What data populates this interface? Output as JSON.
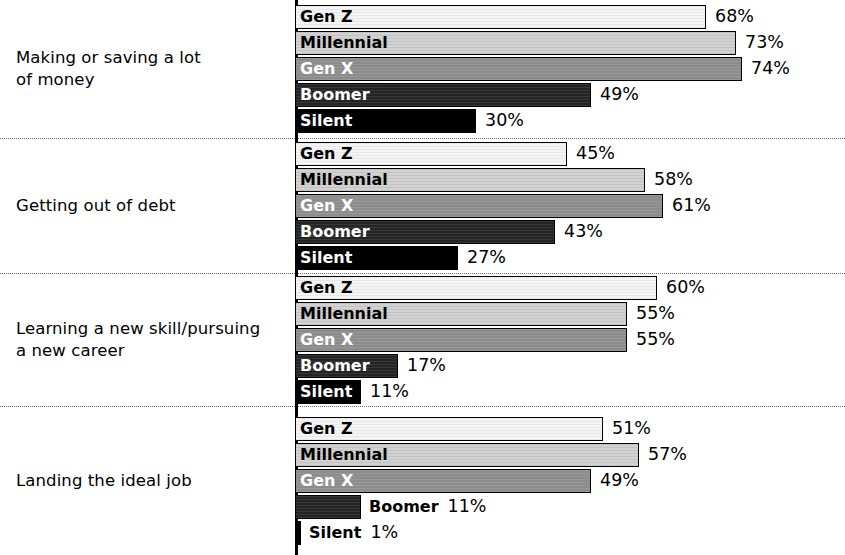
{
  "chart_data": {
    "type": "bar",
    "orientation": "horizontal",
    "title": "",
    "subtitle": "",
    "xlabel": "",
    "ylabel": "",
    "xlim": [
      0,
      100
    ],
    "grid": false,
    "legend_position": "in-bar",
    "value_suffix": "%",
    "series_order": [
      "Gen Z",
      "Millennial",
      "Gen X",
      "Boomer",
      "Silent"
    ],
    "series_colors": {
      "Gen Z": "#f4f4f4",
      "Millennial": "#d2d2d2",
      "Gen X": "#8c8c8c",
      "Boomer": "#242424",
      "Silent": "#000000"
    },
    "categories": [
      "Making or saving a lot of money",
      "Getting out of debt",
      "Learning a new skill/pursuing a new career",
      "Landing the ideal job"
    ],
    "series": [
      {
        "name": "Gen Z",
        "values": [
          68,
          45,
          60,
          51
        ]
      },
      {
        "name": "Millennial",
        "values": [
          73,
          58,
          55,
          57
        ]
      },
      {
        "name": "Gen X",
        "values": [
          74,
          61,
          55,
          49
        ]
      },
      {
        "name": "Boomer",
        "values": [
          49,
          43,
          17,
          11
        ]
      },
      {
        "name": "Silent",
        "values": [
          30,
          27,
          11,
          1
        ]
      }
    ]
  },
  "groups": [
    {
      "category_line1": "Making or saving a lot",
      "category_line2": "of money",
      "bars": [
        {
          "series": "Gen Z",
          "value": 68,
          "value_label": "68%",
          "label_inside": true
        },
        {
          "series": "Millennial",
          "value": 73,
          "value_label": "73%",
          "label_inside": true
        },
        {
          "series": "Gen X",
          "value": 74,
          "value_label": "74%",
          "label_inside": true
        },
        {
          "series": "Boomer",
          "value": 49,
          "value_label": "49%",
          "label_inside": true
        },
        {
          "series": "Silent",
          "value": 30,
          "value_label": "30%",
          "label_inside": true
        }
      ]
    },
    {
      "category_line1": "Getting out of debt",
      "category_line2": "",
      "bars": [
        {
          "series": "Gen Z",
          "value": 45,
          "value_label": "45%",
          "label_inside": true
        },
        {
          "series": "Millennial",
          "value": 58,
          "value_label": "58%",
          "label_inside": true
        },
        {
          "series": "Gen X",
          "value": 61,
          "value_label": "61%",
          "label_inside": true
        },
        {
          "series": "Boomer",
          "value": 43,
          "value_label": "43%",
          "label_inside": true
        },
        {
          "series": "Silent",
          "value": 27,
          "value_label": "27%",
          "label_inside": true
        }
      ]
    },
    {
      "category_line1": "Learning a new skill/pursuing",
      "category_line2": "a new career",
      "bars": [
        {
          "series": "Gen Z",
          "value": 60,
          "value_label": "60%",
          "label_inside": true
        },
        {
          "series": "Millennial",
          "value": 55,
          "value_label": "55%",
          "label_inside": true
        },
        {
          "series": "Gen X",
          "value": 55,
          "value_label": "55%",
          "label_inside": true
        },
        {
          "series": "Boomer",
          "value": 17,
          "value_label": "17%",
          "label_inside": true
        },
        {
          "series": "Silent",
          "value": 11,
          "value_label": "11%",
          "label_inside": true
        }
      ]
    },
    {
      "category_line1": "Landing the ideal job",
      "category_line2": "",
      "bars": [
        {
          "series": "Gen Z",
          "value": 51,
          "value_label": "51%",
          "label_inside": true
        },
        {
          "series": "Millennial",
          "value": 57,
          "value_label": "57%",
          "label_inside": true
        },
        {
          "series": "Gen X",
          "value": 49,
          "value_label": "49%",
          "label_inside": true
        },
        {
          "series": "Boomer",
          "value": 11,
          "value_label": "11%",
          "label_inside": false
        },
        {
          "series": "Silent",
          "value": 1,
          "value_label": "1%",
          "label_inside": false
        }
      ]
    }
  ],
  "layout": {
    "px_per_percent": 6.04,
    "group_heights": [
      138,
      135,
      133,
      149
    ]
  }
}
